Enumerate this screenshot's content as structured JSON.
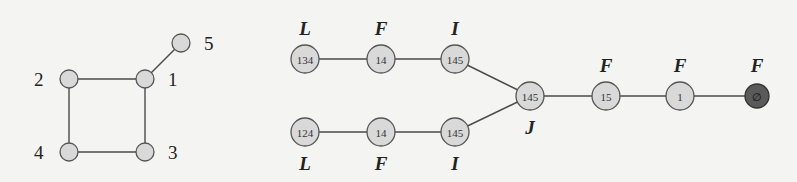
{
  "left_graph": {
    "nodes": [
      {
        "id": "1",
        "label": "1",
        "x": 145,
        "y": 79,
        "lx": 168,
        "ly": 86
      },
      {
        "id": "2",
        "label": "2",
        "x": 69,
        "y": 79,
        "lx": 34,
        "ly": 86
      },
      {
        "id": "3",
        "label": "3",
        "x": 145,
        "y": 152,
        "lx": 168,
        "ly": 159
      },
      {
        "id": "4",
        "label": "4",
        "x": 69,
        "y": 152,
        "lx": 34,
        "ly": 159
      },
      {
        "id": "5",
        "label": "5",
        "x": 181,
        "y": 43,
        "lx": 204,
        "ly": 50
      }
    ],
    "edges": [
      [
        "1",
        "2"
      ],
      [
        "1",
        "3"
      ],
      [
        "2",
        "4"
      ],
      [
        "3",
        "4"
      ],
      [
        "1",
        "5"
      ]
    ]
  },
  "right_graph": {
    "nodes": [
      {
        "id": "a",
        "content": "134",
        "type": "L",
        "x": 305,
        "y": 59,
        "label_pos": "above",
        "dark": false
      },
      {
        "id": "b",
        "content": "14",
        "type": "F",
        "x": 381,
        "y": 59,
        "label_pos": "above",
        "dark": false
      },
      {
        "id": "c",
        "content": "145",
        "type": "I",
        "x": 455,
        "y": 59,
        "label_pos": "above",
        "dark": false
      },
      {
        "id": "d",
        "content": "124",
        "type": "L",
        "x": 305,
        "y": 132,
        "label_pos": "below",
        "dark": false
      },
      {
        "id": "e",
        "content": "14",
        "type": "F",
        "x": 381,
        "y": 132,
        "label_pos": "below",
        "dark": false
      },
      {
        "id": "f",
        "content": "145",
        "type": "I",
        "x": 455,
        "y": 132,
        "label_pos": "below",
        "dark": false
      },
      {
        "id": "g",
        "content": "145",
        "type": "J",
        "x": 530,
        "y": 96,
        "label_pos": "below",
        "dark": false
      },
      {
        "id": "h",
        "content": "15",
        "type": "F",
        "x": 606,
        "y": 96,
        "label_pos": "above",
        "dark": false
      },
      {
        "id": "i",
        "content": "1",
        "type": "F",
        "x": 680,
        "y": 96,
        "label_pos": "above",
        "dark": false
      },
      {
        "id": "j",
        "content": "∅",
        "type": "F",
        "x": 757,
        "y": 96,
        "label_pos": "above",
        "dark": true
      }
    ],
    "edges": [
      [
        "a",
        "b"
      ],
      [
        "b",
        "c"
      ],
      [
        "c",
        "g"
      ],
      [
        "d",
        "e"
      ],
      [
        "e",
        "f"
      ],
      [
        "f",
        "g"
      ],
      [
        "g",
        "h"
      ],
      [
        "h",
        "i"
      ],
      [
        "i",
        "j"
      ]
    ]
  },
  "colors": {
    "node_fill": "#d9d9d9",
    "node_dark_fill": "#5a5a5a",
    "edge": "#4a4a4a",
    "background": "#f4f4f2"
  }
}
